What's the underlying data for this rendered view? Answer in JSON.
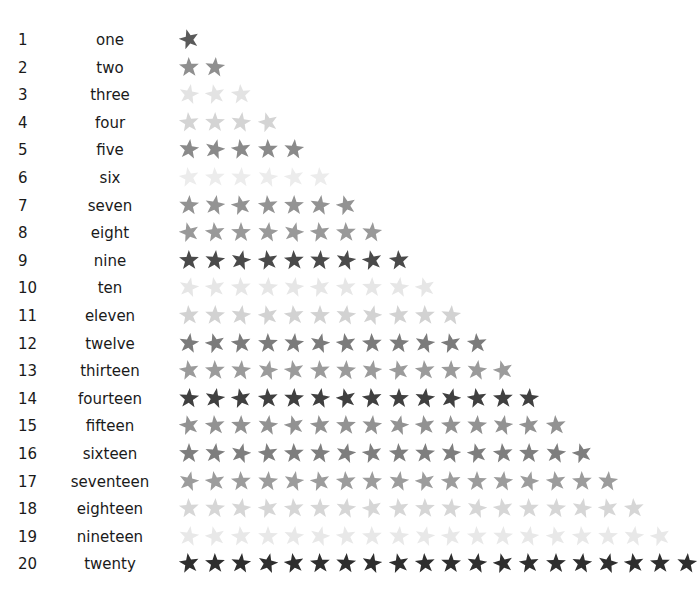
{
  "rows": [
    {
      "number": "1",
      "word": "one",
      "count": 1,
      "color": "#5a5a5a"
    },
    {
      "number": "2",
      "word": "two",
      "count": 2,
      "color": "#8f8f8f"
    },
    {
      "number": "3",
      "word": "three",
      "count": 3,
      "color": "#e3e3e3"
    },
    {
      "number": "4",
      "word": "four",
      "count": 4,
      "color": "#d4d4d4"
    },
    {
      "number": "5",
      "word": "five",
      "count": 5,
      "color": "#8a8a8a"
    },
    {
      "number": "6",
      "word": "six",
      "count": 6,
      "color": "#ececec"
    },
    {
      "number": "7",
      "word": "seven",
      "count": 7,
      "color": "#939393"
    },
    {
      "number": "8",
      "word": "eight",
      "count": 8,
      "color": "#999999"
    },
    {
      "number": "9",
      "word": "nine",
      "count": 9,
      "color": "#4a4a4a"
    },
    {
      "number": "10",
      "word": "ten",
      "count": 10,
      "color": "#e6e6e6"
    },
    {
      "number": "11",
      "word": "eleven",
      "count": 11,
      "color": "#d2d2d2"
    },
    {
      "number": "12",
      "word": "twelve",
      "count": 12,
      "color": "#7b7b7b"
    },
    {
      "number": "13",
      "word": "thirteen",
      "count": 13,
      "color": "#9b9b9b"
    },
    {
      "number": "14",
      "word": "fourteen",
      "count": 14,
      "color": "#404040"
    },
    {
      "number": "15",
      "word": "fifteen",
      "count": 15,
      "color": "#929292"
    },
    {
      "number": "16",
      "word": "sixteen",
      "count": 16,
      "color": "#7e7e7e"
    },
    {
      "number": "17",
      "word": "seventeen",
      "count": 17,
      "color": "#9c9c9c"
    },
    {
      "number": "18",
      "word": "eighteen",
      "count": 18,
      "color": "#d6d6d6"
    },
    {
      "number": "19",
      "word": "nineteen",
      "count": 19,
      "color": "#e8e8e8"
    },
    {
      "number": "20",
      "word": "twenty",
      "count": 20,
      "color": "#2e2e2e"
    }
  ],
  "icon": "star-icon"
}
